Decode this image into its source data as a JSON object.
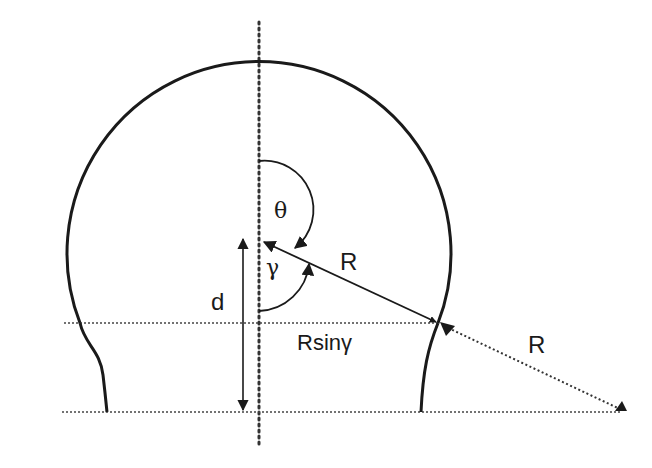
{
  "diagram": {
    "labels": {
      "theta": "θ",
      "gamma": "γ",
      "radius_inner": "R",
      "radius_outer": "R",
      "height": "d",
      "horizontal": "Rsinγ"
    },
    "colors": {
      "stroke": "#1a1a1a",
      "dotted": "#333333",
      "background": "#ffffff"
    }
  }
}
